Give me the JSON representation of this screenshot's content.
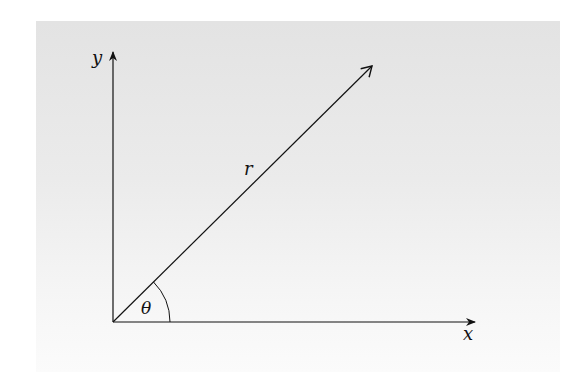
{
  "diagram": {
    "type": "polar-coordinates",
    "labels": {
      "x_axis": "x",
      "y_axis": "y",
      "radius": "r",
      "angle": "θ"
    },
    "colors": {
      "stroke": "#111111",
      "panel_top": "#e3e3e3",
      "panel_bottom": "#fbfbfb"
    }
  }
}
